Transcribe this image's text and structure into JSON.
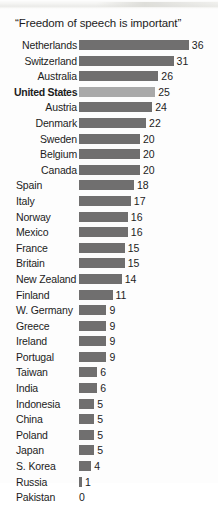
{
  "chart_data": {
    "type": "bar",
    "title": "“Freedom of speech is important”",
    "xlabel": "",
    "ylabel": "",
    "orientation": "horizontal",
    "grid": false,
    "legend": false,
    "xlim": [
      0,
      36
    ],
    "value_labels_shown": true,
    "highlight_category": "United States",
    "colors": {
      "bar": "#706f6f",
      "highlight_bar": "#a9a9a9",
      "text": "#1c1c1c",
      "background": "#fdfdfd"
    },
    "categories": [
      "Netherlands",
      "Switzerland",
      "Australia",
      "United States",
      "Austria",
      "Denmark",
      "Sweden",
      "Belgium",
      "Canada",
      "Spain",
      "Italy",
      "Norway",
      "Mexico",
      "France",
      "Britain",
      "New Zealand",
      "Finland",
      "W. Germany",
      "Greece",
      "Ireland",
      "Portugal",
      "Taiwan",
      "India",
      "Indonesia",
      "China",
      "Poland",
      "Japan",
      "S. Korea",
      "Russia",
      "Pakistan"
    ],
    "values": [
      36,
      31,
      26,
      25,
      24,
      22,
      20,
      20,
      20,
      18,
      17,
      16,
      16,
      15,
      15,
      14,
      11,
      9,
      9,
      9,
      9,
      6,
      6,
      5,
      5,
      5,
      5,
      4,
      1,
      0
    ]
  },
  "rows": [
    {
      "label": "Netherlands",
      "value": 36,
      "value_text": "36",
      "align": "align-right",
      "highlight": false
    },
    {
      "label": "Switzerland",
      "value": 31,
      "value_text": "31",
      "align": "align-right",
      "highlight": false
    },
    {
      "label": "Australia",
      "value": 26,
      "value_text": "26",
      "align": "align-right",
      "highlight": false
    },
    {
      "label": "United States",
      "value": 25,
      "value_text": "25",
      "align": "align-right",
      "highlight": true
    },
    {
      "label": "Austria",
      "value": 24,
      "value_text": "24",
      "align": "align-right",
      "highlight": false
    },
    {
      "label": "Denmark",
      "value": 22,
      "value_text": "22",
      "align": "align-right",
      "highlight": false
    },
    {
      "label": "Sweden",
      "value": 20,
      "value_text": "20",
      "align": "align-right",
      "highlight": false
    },
    {
      "label": "Belgium",
      "value": 20,
      "value_text": "20",
      "align": "align-right",
      "highlight": false
    },
    {
      "label": "Canada",
      "value": 20,
      "value_text": "20",
      "align": "align-right",
      "highlight": false
    },
    {
      "label": "Spain",
      "value": 18,
      "value_text": "18",
      "align": "align-left",
      "highlight": false
    },
    {
      "label": "Italy",
      "value": 17,
      "value_text": "17",
      "align": "align-left",
      "highlight": false
    },
    {
      "label": "Norway",
      "value": 16,
      "value_text": "16",
      "align": "align-left",
      "highlight": false
    },
    {
      "label": "Mexico",
      "value": 16,
      "value_text": "16",
      "align": "align-left",
      "highlight": false
    },
    {
      "label": "France",
      "value": 15,
      "value_text": "15",
      "align": "align-left",
      "highlight": false
    },
    {
      "label": "Britain",
      "value": 15,
      "value_text": "15",
      "align": "align-left",
      "highlight": false
    },
    {
      "label": "New Zealand",
      "value": 14,
      "value_text": "14",
      "align": "align-left",
      "highlight": false
    },
    {
      "label": "Finland",
      "value": 11,
      "value_text": "11",
      "align": "align-left",
      "highlight": false
    },
    {
      "label": "W. Germany",
      "value": 9,
      "value_text": "9",
      "align": "align-left",
      "highlight": false
    },
    {
      "label": "Greece",
      "value": 9,
      "value_text": "9",
      "align": "align-left",
      "highlight": false
    },
    {
      "label": "Ireland",
      "value": 9,
      "value_text": "9",
      "align": "align-left",
      "highlight": false
    },
    {
      "label": "Portugal",
      "value": 9,
      "value_text": "9",
      "align": "align-left",
      "highlight": false
    },
    {
      "label": "Taiwan",
      "value": 6,
      "value_text": "6",
      "align": "align-left",
      "highlight": false
    },
    {
      "label": "India",
      "value": 6,
      "value_text": "6",
      "align": "align-left",
      "highlight": false
    },
    {
      "label": "Indonesia",
      "value": 5,
      "value_text": "5",
      "align": "align-left",
      "highlight": false
    },
    {
      "label": "China",
      "value": 5,
      "value_text": "5",
      "align": "align-left",
      "highlight": false
    },
    {
      "label": "Poland",
      "value": 5,
      "value_text": "5",
      "align": "align-left",
      "highlight": false
    },
    {
      "label": "Japan",
      "value": 5,
      "value_text": "5",
      "align": "align-left",
      "highlight": false
    },
    {
      "label": "S. Korea",
      "value": 4,
      "value_text": "4",
      "align": "align-left",
      "highlight": false
    },
    {
      "label": "Russia",
      "value": 1,
      "value_text": "1",
      "align": "align-left",
      "highlight": false
    },
    {
      "label": "Pakistan",
      "value": 0,
      "value_text": "0",
      "align": "align-left",
      "highlight": false
    }
  ],
  "layout": {
    "bar_origin_px": 79,
    "px_per_unit": 3.05,
    "value_gap_px": 3
  }
}
